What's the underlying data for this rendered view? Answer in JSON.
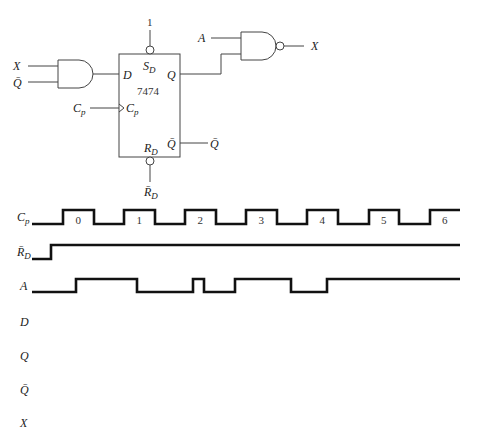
{
  "circuit": {
    "and_gate": {
      "inputs": [
        "X",
        "Q̄"
      ],
      "output": "D"
    },
    "flip_flop": {
      "chip": "7474",
      "pins": {
        "set": "S",
        "set_sub": "D",
        "reset": "R",
        "reset_sub": "D",
        "data": "D",
        "clock": "C",
        "clock_sub": "p",
        "q": "Q",
        "qbar": "Q̄"
      },
      "set_input": "1",
      "reset_input": "R̄",
      "reset_input_sub": "D",
      "clock_input": "C",
      "clock_input_sub": "p",
      "qbar_output": "Q̄"
    },
    "nand_gate": {
      "inputs": [
        "A",
        "Q"
      ],
      "output": "X"
    }
  },
  "timing": {
    "signals": [
      {
        "name": "C",
        "sub": "p"
      },
      {
        "name": "R̄",
        "sub": "D"
      },
      {
        "name": "A",
        "sub": ""
      },
      {
        "name": "D",
        "sub": ""
      },
      {
        "name": "Q",
        "sub": ""
      },
      {
        "name": "Q̄",
        "sub": ""
      },
      {
        "name": "X",
        "sub": ""
      }
    ],
    "clock_pulse_numbers": [
      "0",
      "1",
      "2",
      "3",
      "4",
      "5",
      "6"
    ],
    "waveforms": {
      "Cp": {
        "start_x": 32,
        "end_x": 460,
        "initial": 0,
        "edges": [
          63,
          94,
          124,
          155,
          185,
          216,
          246,
          277,
          307,
          338,
          369,
          399,
          430
        ]
      },
      "RD": {
        "start_x": 32,
        "end_x": 460,
        "initial": 0,
        "edges": [
          51
        ]
      },
      "A": {
        "start_x": 32,
        "end_x": 460,
        "initial": 0,
        "edges": [
          76,
          137,
          193,
          204,
          235,
          291,
          327
        ]
      },
      "D": null,
      "Q": null,
      "Qbar": null,
      "X": null
    }
  }
}
